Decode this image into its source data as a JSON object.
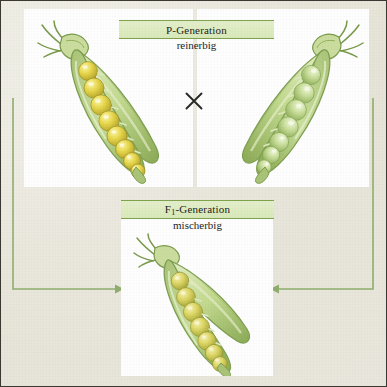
{
  "figure": {
    "background_color": "#e9e7dd",
    "border_color": "#3a3a32",
    "band_color": "#d9e9b9",
    "band_border_color": "#7fa24f",
    "arrow_color": "#8fae6e"
  },
  "parent_generation": {
    "band_label": "P-Generation",
    "band_label_main": "P-Generation",
    "sub_label": "reinerbig",
    "cross_symbol": "×"
  },
  "f1_generation": {
    "band_label": "F1-Generation",
    "band_label_prefix": "F",
    "band_label_subscript": "1",
    "band_label_suffix": "-Generation",
    "sub_label": "mischerbig"
  },
  "specimens": [
    {
      "id": "parent-left",
      "name": "pea-pod-yellow",
      "pea_color": "#e3d54a",
      "pea_color_shade": "#b9aa2c",
      "pod_color": "#c3d98e",
      "pod_shade": "#8fae5a",
      "pea_count": 8,
      "orientation": "stem-top-left"
    },
    {
      "id": "parent-right",
      "name": "pea-pod-green",
      "pea_color": "#cfe0a8",
      "pea_color_shade": "#9dbb72",
      "pod_color": "#c3d98e",
      "pod_shade": "#8fae5a",
      "pea_count": 7,
      "orientation": "stem-top-right"
    },
    {
      "id": "f1",
      "name": "pea-pod-yellow-green",
      "pea_color": "#d8d45c",
      "pea_color_shade": "#adad3a",
      "pod_color": "#c3d98e",
      "pod_shade": "#8fae5a",
      "pea_count": 8,
      "orientation": "stem-top-left"
    }
  ]
}
